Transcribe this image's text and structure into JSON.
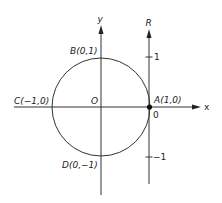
{
  "diagram": {
    "axes": {
      "x_label": "x",
      "y_label": "y",
      "r_label": "R"
    },
    "origin_label": "O",
    "points": {
      "A": "A(1,0)",
      "B": "B(0,1)",
      "C": "C(−1,0)",
      "D": "D(0,−1)"
    },
    "r_axis_ticks": {
      "plus_one": "1",
      "zero": "0",
      "minus_one": "−1"
    },
    "colors": {
      "line": "#333333",
      "background": "#ffffff"
    }
  }
}
